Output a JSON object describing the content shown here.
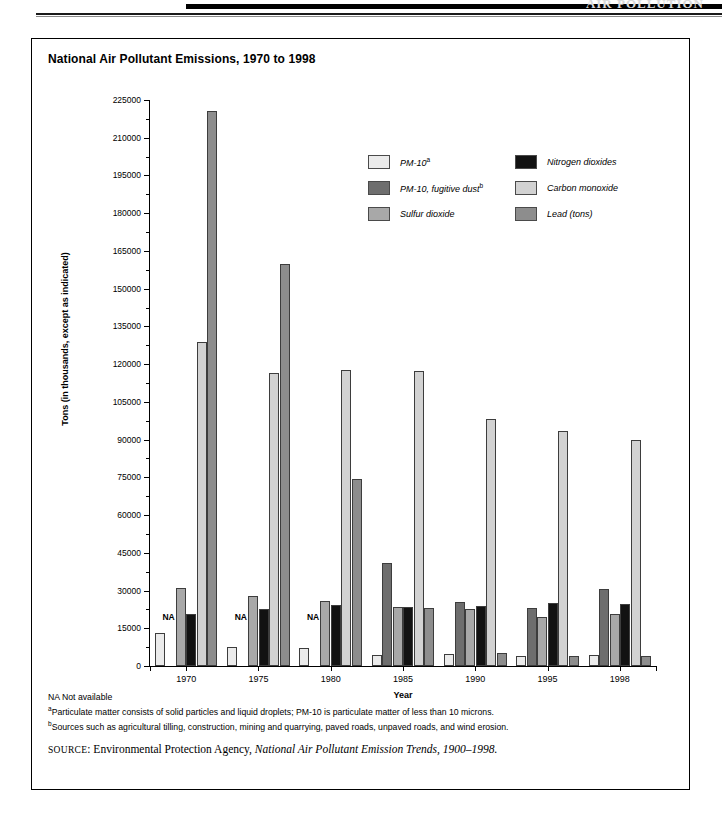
{
  "header": {
    "running_head": "AIR POLLUTION"
  },
  "chart_title": "National Air Pollutant Emissions, 1970 to 1998",
  "axis": {
    "ylabel": "Tons (in thousands, except as indicated)",
    "xlabel": "Year",
    "yticks": [
      0,
      15000,
      30000,
      45000,
      60000,
      75000,
      90000,
      105000,
      120000,
      135000,
      150000,
      165000,
      180000,
      195000,
      210000,
      225000
    ],
    "ytick_labels": [
      "0",
      "15000",
      "30000",
      "45000",
      "60000",
      "75000",
      "90000",
      "105000",
      "120000",
      "135000",
      "150000",
      "165000",
      "180000",
      "195000",
      "210000",
      "225000"
    ],
    "ymin": 0,
    "ymax": 225000
  },
  "legend": [
    {
      "label": "PM-10",
      "sup": "a",
      "color": "#ebebeb",
      "name": "pm10"
    },
    {
      "label": "Nitrogen dioxides",
      "sup": "",
      "color": "#121212",
      "name": "nitrogen-dioxides"
    },
    {
      "label": "PM-10, fugitive dust",
      "sup": "b",
      "color": "#6e6e6e",
      "name": "pm10-fugitive-dust"
    },
    {
      "label": "Carbon monoxide",
      "sup": "",
      "color": "#d2d2d2",
      "name": "carbon-monoxide"
    },
    {
      "label": "Sulfur dioxide",
      "sup": "",
      "color": "#a8a8a8",
      "name": "sulfur-dioxide"
    },
    {
      "label": "Lead (tons)",
      "sup": "",
      "color": "#8d8d8d",
      "name": "lead-tons"
    }
  ],
  "na_note": "NA",
  "notes": [
    {
      "sup": "",
      "text": "NA Not available"
    },
    {
      "sup": "a",
      "text": "Particulate matter consists of solid particles and liquid droplets; PM-10 is particulate matter of less than 10 microns."
    },
    {
      "sup": "b",
      "text": "Sources such as agricultural tilling, construction, mining and quarrying, paved roads, unpaved roads, and wind erosion."
    }
  ],
  "source": {
    "prefix": "SOURCE",
    "agency": ": Environmental Protection Agency, ",
    "title": "National Air Pollutant Emission Trends, 1900–1998."
  },
  "chart_data": {
    "type": "bar",
    "title": "National Air Pollutant Emissions, 1970 to 1998",
    "xlabel": "Year",
    "ylabel": "Tons (in thousands, except as indicated)",
    "ylim": [
      0,
      225000
    ],
    "grid": false,
    "legend_position": "upper-right-inside",
    "categories": [
      "1970",
      "1975",
      "1980",
      "1985",
      "1990",
      "1995",
      "1998"
    ],
    "series": [
      {
        "name": "PM-10",
        "color": "#ebebeb",
        "values": [
          13000,
          7500,
          7000,
          4500,
          4900,
          4100,
          4300
        ]
      },
      {
        "name": "PM-10, fugitive dust",
        "color": "#6e6e6e",
        "values": [
          null,
          null,
          null,
          41000,
          25500,
          23000,
          30700
        ]
      },
      {
        "name": "Sulfur dioxide",
        "color": "#a8a8a8",
        "values": [
          31200,
          28000,
          25900,
          23300,
          22700,
          19600,
          20800
        ]
      },
      {
        "name": "Nitrogen dioxides",
        "color": "#121212",
        "values": [
          20600,
          22500,
          24100,
          23600,
          24000,
          25200,
          24700
        ]
      },
      {
        "name": "Carbon monoxide",
        "color": "#d2d2d2",
        "values": [
          129000,
          116500,
          117600,
          117300,
          98300,
          93500,
          89800
        ]
      },
      {
        "name": "Lead (tons)",
        "color": "#8d8d8d",
        "values": [
          220500,
          159700,
          74200,
          22900,
          5000,
          3900,
          4000
        ]
      }
    ],
    "annotations": [
      {
        "category": "1970",
        "series": "PM-10, fugitive dust",
        "text": "NA"
      },
      {
        "category": "1975",
        "series": "PM-10, fugitive dust",
        "text": "NA"
      },
      {
        "category": "1980",
        "series": "PM-10, fugitive dust",
        "text": "NA"
      }
    ]
  }
}
